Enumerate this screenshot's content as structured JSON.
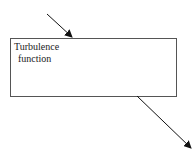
{
  "diagram": {
    "block": {
      "label_line1": "Turbulence",
      "label_line2": "function",
      "x": 10,
      "y": 38,
      "width": 166,
      "height": 58,
      "stroke": "#555555"
    },
    "arrows": [
      {
        "name": "input-arrow",
        "x1": 47,
        "y1": 14,
        "x2": 72,
        "y2": 37
      },
      {
        "name": "output-arrow",
        "x1": 137,
        "y1": 96,
        "x2": 191,
        "y2": 148
      }
    ],
    "arrow_color": "#111111"
  }
}
